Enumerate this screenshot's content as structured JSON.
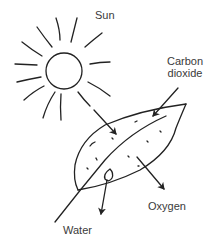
{
  "diagram": {
    "labels": {
      "sun": "Sun",
      "carbon_dioxide_line1": "Carbon",
      "carbon_dioxide_line2": "dioxide",
      "oxygen": "Oxygen",
      "water": "Water"
    },
    "colors": {
      "stroke": "#222222",
      "text": "#3a3a3a",
      "background": "#ffffff"
    },
    "elements": [
      {
        "id": "sun",
        "shape": "circle with rays",
        "center": [
          64,
          71
        ],
        "radius": 18
      },
      {
        "id": "leaf",
        "shape": "leaf outline with midrib and stem"
      },
      {
        "id": "arrow-sunlight",
        "from": "sun",
        "to": "leaf",
        "direction": "in"
      },
      {
        "id": "arrow-carbon-dioxide",
        "from": "Carbon dioxide",
        "to": "leaf",
        "direction": "in"
      },
      {
        "id": "arrow-oxygen",
        "from": "leaf",
        "to": "Oxygen",
        "direction": "out"
      },
      {
        "id": "arrow-water",
        "from": "leaf",
        "to": "Water",
        "direction": "out"
      }
    ]
  }
}
